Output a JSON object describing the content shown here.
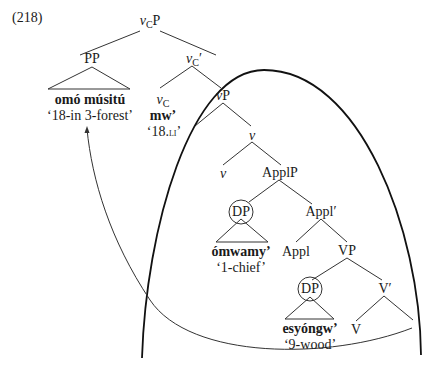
{
  "example_number": "(218)",
  "tree": {
    "root": {
      "cat_italic": "v",
      "cat_sub": "C",
      "cat_rest": "P"
    },
    "pp": {
      "label": "PP",
      "form": "omó músitú",
      "gloss": "‘18-in 3-forest’"
    },
    "vc_bar": {
      "cat_italic": "v",
      "cat_sub": "C",
      "cat_rest": "′"
    },
    "vc_head": {
      "cat_italic": "v",
      "cat_sub": "C",
      "form": "mw’",
      "gloss_open": "‘18.",
      "gloss_sc": "li",
      "gloss_close": "’"
    },
    "vp": {
      "cat_italic": "v",
      "cat_rest": "P"
    },
    "v_bar": {
      "cat_italic": "v"
    },
    "v_head": {
      "cat_italic": "v"
    },
    "applp": {
      "label": "ApplP"
    },
    "dp1": {
      "label": "DP",
      "form": "ómwamy’",
      "gloss": "‘1-chief’"
    },
    "appl_bar": {
      "label": "Appl′"
    },
    "appl_head": {
      "label": "Appl"
    },
    "vp_lower": {
      "label": "VP"
    },
    "dp2": {
      "label": "DP",
      "form": "esyóngw’",
      "gloss": "‘9-wood’"
    },
    "V_bar": {
      "label": "V′"
    },
    "V_head": {
      "label": "V"
    }
  },
  "annotations": {
    "phase_boundary": "large arc enclosing vP",
    "movement_arrow": "from inside phase to PP",
    "circled_nodes": [
      "DP (ómwamy’)",
      "DP (esyóngw’)"
    ]
  }
}
